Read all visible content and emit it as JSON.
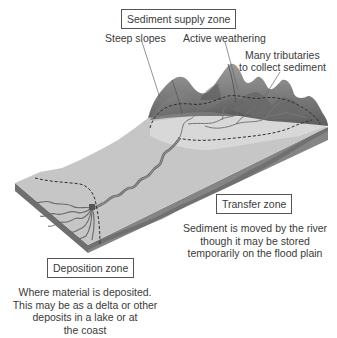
{
  "diagram": {
    "zones": {
      "supply": {
        "title": "Sediment supply zone",
        "annotations": {
          "steep_slopes": "Steep slopes",
          "active_weathering": "Active weathering",
          "tributaries_line1": "Many tributaries",
          "tributaries_line2": "to collect sediment"
        }
      },
      "transfer": {
        "title": "Transfer zone",
        "description": [
          "Sediment is moved by the river",
          "though it may be stored",
          "temporarily on the flood plain"
        ]
      },
      "deposition": {
        "title": "Deposition zone",
        "description": [
          "Where material is deposited.",
          "This may be as a delta or other",
          "deposits in a lake or at",
          "the coast"
        ]
      }
    },
    "colors": {
      "slab_top": "#c4c4c4",
      "slab_side": "#7a7a7a",
      "mountain_dark": "#6e6e6e",
      "mountain_mid": "#8a8a8a",
      "river": "#6a6a6a",
      "boundary_dash": "#333333"
    }
  }
}
